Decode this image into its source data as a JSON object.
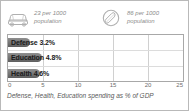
{
  "stats": [
    {
      "icon": "car-icon",
      "value_line1": "23 per 1000",
      "value_line2": "population",
      "number": 23,
      "unit": "per 1000 population"
    },
    {
      "icon": "telephone-icon",
      "value_line1": "86 per 1000",
      "value_line2": "population",
      "number": 86,
      "unit": "per 1000 population"
    }
  ],
  "caption": "Defense, Health, Education spending as % of GDP",
  "colors": {
    "bar_light": "#8f8f8f",
    "bar_dark": "#5e5e5e",
    "grid": "#d0d0d0",
    "panel_border": "#a8a8a8",
    "stat_text": "#8c8c8c",
    "caption_text": "#5a5a5a"
  },
  "chart_data": {
    "type": "bar",
    "orientation": "horizontal",
    "title": "",
    "xlabel": "Defense, Health, Education spending as % of GDP",
    "ylabel": "",
    "categories": [
      "Defense",
      "Education",
      "Health"
    ],
    "values": [
      3.2,
      4.8,
      4.6
    ],
    "bar_labels": [
      "Defense 3.2%",
      "Education 4.8%",
      "Health 4.6%"
    ],
    "xlim": [
      0,
      25
    ],
    "ticks": [
      "0",
      "5",
      "10",
      "15",
      "20",
      "25"
    ],
    "tick_values": [
      0,
      5,
      10,
      15,
      20,
      25
    ],
    "grid": true,
    "legend": false
  }
}
